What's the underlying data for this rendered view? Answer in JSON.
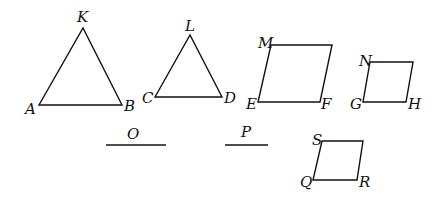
{
  "diagram": {
    "triangles": [
      {
        "name": "AKB",
        "apex": "K",
        "left": "A",
        "right": "B",
        "points": [
          [
            39,
            105
          ],
          [
            83,
            28
          ],
          [
            122,
            105
          ]
        ]
      },
      {
        "name": "CLD",
        "apex": "L",
        "left": "C",
        "right": "D",
        "points": [
          [
            155,
            97
          ],
          [
            190,
            35
          ],
          [
            222,
            97
          ]
        ]
      }
    ],
    "parallelograms": [
      {
        "name": "MEF",
        "labels": [
          "M",
          "E",
          "F"
        ],
        "points": [
          [
            271,
            45
          ],
          [
            332,
            45
          ],
          [
            320,
            102
          ],
          [
            258,
            102
          ]
        ]
      },
      {
        "name": "NGH",
        "labels": [
          "N",
          "G",
          "H"
        ],
        "points": [
          [
            370,
            62
          ],
          [
            413,
            62
          ],
          [
            406,
            102
          ],
          [
            363,
            102
          ]
        ]
      },
      {
        "name": "SQR",
        "labels": [
          "S",
          "Q",
          "R"
        ],
        "points": [
          [
            322,
            141
          ],
          [
            363,
            141
          ],
          [
            357,
            180
          ],
          [
            313,
            180
          ]
        ]
      }
    ],
    "segments": [
      {
        "name": "O",
        "x1": 106,
        "x2": 166,
        "y": 145
      },
      {
        "name": "P",
        "x1": 225,
        "x2": 268,
        "y": 145
      }
    ],
    "labels": {
      "K": "K",
      "A": "A",
      "B": "B",
      "L": "L",
      "C": "C",
      "D": "D",
      "M": "M",
      "E": "E",
      "F": "F",
      "N": "N",
      "G": "G",
      "H": "H",
      "S": "S",
      "Q": "Q",
      "R": "R",
      "O": "O",
      "P": "P"
    },
    "stroke_color": "#111111",
    "background": "#ffffff"
  }
}
